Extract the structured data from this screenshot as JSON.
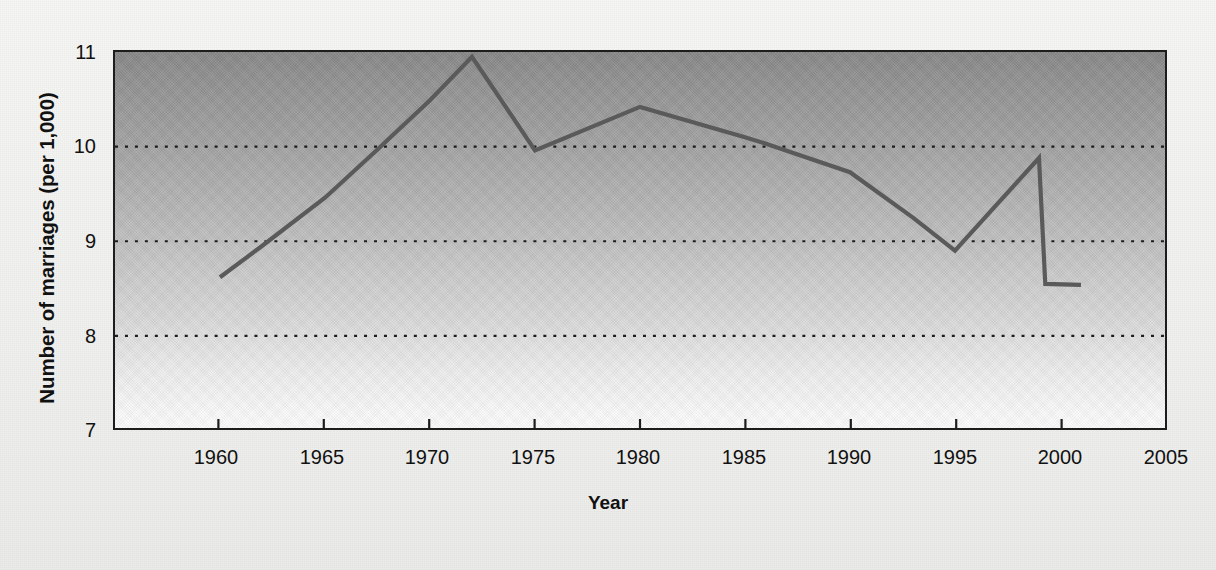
{
  "chart_data": {
    "type": "line",
    "title": "",
    "xlabel": "Year",
    "ylabel": "Number of marriages (per 1,000)",
    "xlim": [
      1955,
      2005
    ],
    "ylim": [
      7,
      11
    ],
    "xticks": [
      1960,
      1965,
      1970,
      1975,
      1980,
      1985,
      1990,
      1995,
      2000,
      2005
    ],
    "xtick_labels": [
      "1960",
      "1965",
      "1970",
      "1975",
      "1980",
      "1985",
      "1990",
      "1995",
      "2000",
      "2005"
    ],
    "yticks": [
      7,
      8,
      9,
      10,
      11
    ],
    "ytick_labels": [
      "7",
      "8",
      "9",
      "10",
      "11"
    ],
    "gridlines_y": [
      8,
      9,
      10
    ],
    "grid": "horizontal-dotted",
    "legend": "none",
    "series": [
      {
        "name": "Number of marriages (per 1,000)",
        "color": "#5a5a5a",
        "x": [
          1960,
          1962,
          1965,
          1967.5,
          1970,
          1972,
          1975,
          1980,
          1985,
          1986,
          1990,
          1993,
          1995,
          1999,
          1999.3,
          2001
        ],
        "values": [
          8.62,
          8.95,
          9.46,
          9.97,
          10.49,
          10.95,
          9.96,
          10.42,
          10.1,
          10.03,
          9.73,
          9.25,
          8.9,
          9.88,
          8.55,
          8.54
        ]
      }
    ],
    "colors": {
      "line": "#5a5a5a",
      "plot_border": "#1d1d1d",
      "grid": "#1d1d1d",
      "background": "#f2f2f0",
      "plot_top": "#878787",
      "plot_bottom": "#fdfdfd",
      "text": "#111111"
    }
  }
}
